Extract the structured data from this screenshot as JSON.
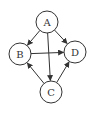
{
  "diagram": {
    "type": "directed-graph",
    "nodes": [
      {
        "id": "A",
        "label": "A",
        "cx": 47,
        "cy": 22,
        "r": 11
      },
      {
        "id": "B",
        "label": "B",
        "cx": 20,
        "cy": 54,
        "r": 11
      },
      {
        "id": "D",
        "label": "D",
        "cx": 75,
        "cy": 52,
        "r": 11
      },
      {
        "id": "C",
        "label": "C",
        "cx": 51,
        "cy": 92,
        "r": 11
      }
    ],
    "edges": [
      {
        "from": "A",
        "to": "B"
      },
      {
        "from": "A",
        "to": "D"
      },
      {
        "from": "A",
        "to": "C"
      },
      {
        "from": "B",
        "to": "D"
      },
      {
        "from": "C",
        "to": "B"
      },
      {
        "from": "C",
        "to": "D"
      }
    ],
    "colors": {
      "stroke": "#333333",
      "background": "#ffffff"
    }
  }
}
